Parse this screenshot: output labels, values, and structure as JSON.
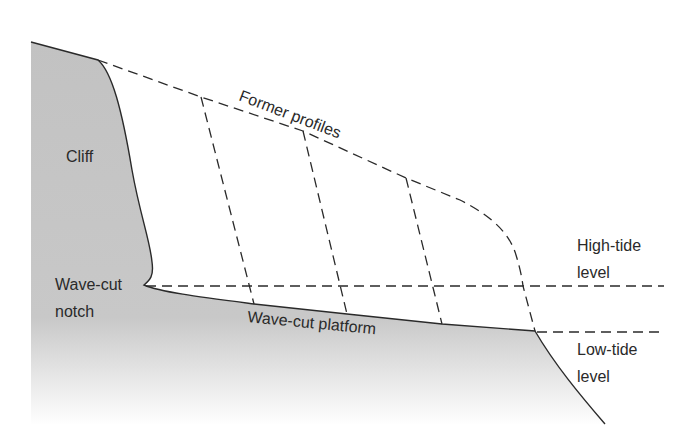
{
  "diagram": {
    "labels": {
      "cliff": "Cliff",
      "former_profiles": "Former profiles",
      "notch_line1": "Wave-cut",
      "notch_line2": "notch",
      "platform": "Wave-cut platform",
      "high_tide_line1": "High-tide",
      "high_tide_line2": "level",
      "low_tide_line1": "Low-tide",
      "low_tide_line2": "level"
    },
    "colors": {
      "rock_fill": "#c4c4c4",
      "line": "#2a2a2a",
      "background": "#ffffff"
    }
  }
}
